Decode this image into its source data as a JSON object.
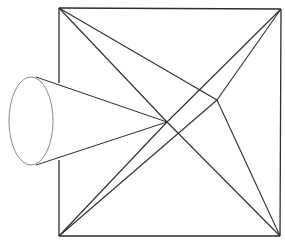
{
  "diagram": {
    "colors": {
      "background": "#ffffff",
      "line": "#2e2e2e",
      "ellipse": "#8a8a8a"
    },
    "square": {
      "top_left": [
        59,
        8
      ],
      "top_right": [
        281,
        9
      ],
      "bottom_right": [
        280,
        236
      ],
      "bottom_left": [
        59,
        236
      ]
    },
    "points": {
      "p1": [
        167,
        122
      ],
      "p2": [
        217,
        100
      ]
    },
    "cone": {
      "ellipse_center": [
        31,
        121
      ],
      "rx": 22,
      "ry": 44,
      "tangent_top": [
        36,
        77
      ],
      "tangent_bottom": [
        36,
        165
      ],
      "apex": [
        167,
        122
      ]
    },
    "hidden_left_edge_segment": [
      83,
      160
    ]
  }
}
